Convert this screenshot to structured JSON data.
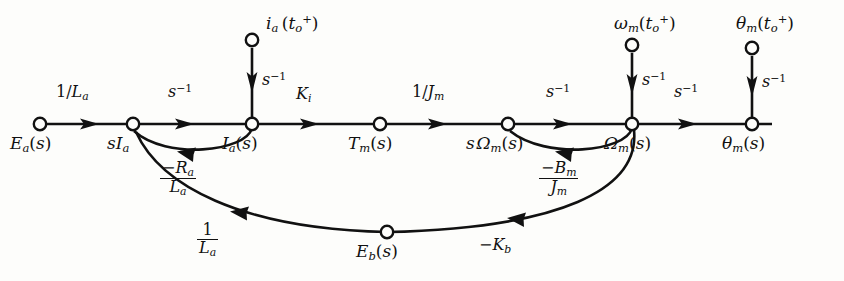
{
  "diagram": {
    "type": "signal-flow-graph",
    "stroke_color": "#111111",
    "background_color": "#fdfdfb"
  },
  "nodes": [
    {
      "id": "Ea",
      "label": "E_a(s)",
      "x": 40,
      "y": 124,
      "label_x": 10,
      "label_y": 133,
      "kind": "source"
    },
    {
      "id": "sIa",
      "label": "sI_a",
      "x": 133,
      "y": 124,
      "label_x": 107,
      "label_y": 133,
      "kind": "internal"
    },
    {
      "id": "Ia",
      "label": "I_a(s)",
      "x": 252,
      "y": 124,
      "label_x": 222,
      "label_y": 133,
      "kind": "internal"
    },
    {
      "id": "Tm",
      "label": "T_m(s)",
      "x": 380,
      "y": 124,
      "label_x": 348,
      "label_y": 133,
      "kind": "internal"
    },
    {
      "id": "sOmegam",
      "label": "sΩ_m(s)",
      "x": 508,
      "y": 124,
      "label_x": 468,
      "label_y": 133,
      "kind": "internal"
    },
    {
      "id": "Omegam",
      "label": "Ω_m(s)",
      "x": 632,
      "y": 124,
      "label_x": 606,
      "label_y": 133,
      "kind": "internal"
    },
    {
      "id": "thetam",
      "label": "θ_m(s)",
      "x": 752,
      "y": 124,
      "label_x": 724,
      "label_y": 133,
      "kind": "output"
    },
    {
      "id": "ia0",
      "label": "i_a(t_o^+)",
      "x": 252,
      "y": 40,
      "label_x": 266,
      "label_y": 12,
      "kind": "initial-condition"
    },
    {
      "id": "omega0",
      "label": "ω_m(t_o^+)",
      "x": 632,
      "y": 45,
      "label_x": 618,
      "label_y": 12,
      "kind": "initial-condition"
    },
    {
      "id": "theta0",
      "label": "θ_m(t_o^+)",
      "x": 752,
      "y": 48,
      "label_x": 740,
      "label_y": 12,
      "kind": "initial-condition"
    }
  ],
  "branches": [
    {
      "id": "b1",
      "from": "Ea",
      "to": "sIa",
      "gain": "1/L_a",
      "gain_x": 62,
      "gain_y": 82,
      "shape": "straight"
    },
    {
      "id": "b2",
      "from": "sIa",
      "to": "Ia",
      "gain": "s^-1",
      "gain_x": 172,
      "gain_y": 82,
      "shape": "straight"
    },
    {
      "id": "b3",
      "from": "Ia",
      "to": "Tm",
      "gain": "K_i",
      "gain_x": 298,
      "gain_y": 84,
      "shape": "straight"
    },
    {
      "id": "b4",
      "from": "Tm",
      "to": "sOmegam",
      "gain": "1/J_m",
      "gain_x": 418,
      "gain_y": 82,
      "shape": "straight"
    },
    {
      "id": "b5",
      "from": "sOmegam",
      "to": "Omegam",
      "gain": "s^-1",
      "gain_x": 550,
      "gain_y": 82,
      "shape": "straight"
    },
    {
      "id": "b6",
      "from": "Omegam",
      "to": "thetam",
      "gain": "s^-1",
      "gain_x": 678,
      "gain_y": 82,
      "shape": "straight"
    },
    {
      "id": "b7",
      "from": "ia0",
      "to": "Ia",
      "gain": "s^-1",
      "gain_x": 262,
      "gain_y": 72,
      "shape": "vertical"
    },
    {
      "id": "b8",
      "from": "omega0",
      "to": "Omegam",
      "gain": "s^-1",
      "gain_x": 642,
      "gain_y": 72,
      "shape": "vertical"
    },
    {
      "id": "b9",
      "from": "theta0",
      "to": "thetam",
      "gain": "s^-1",
      "gain_x": 762,
      "gain_y": 74,
      "shape": "vertical"
    },
    {
      "id": "b10",
      "from": "Ia",
      "to": "sIa",
      "gain": "-R_a/L_a",
      "gain_x": 172,
      "gain_y": 143,
      "shape": "arc-below-short"
    },
    {
      "id": "b11",
      "from": "Omegam",
      "to": "sOmegam",
      "gain": "-B_m/J_m",
      "gain_x": 551,
      "gain_y": 143,
      "shape": "arc-below-short"
    },
    {
      "id": "b12",
      "from": "Omegam",
      "to": "Eb",
      "gain": "-K_b",
      "gain_x": 487,
      "gain_y": 241,
      "shape": "arc-below-long"
    },
    {
      "id": "b13",
      "from": "Eb",
      "to": "sIa",
      "gain": "1/L_a",
      "gain_x": 205,
      "gain_y": 228,
      "shape": "arc-below-long"
    }
  ],
  "bottom_node": {
    "id": "Eb",
    "label": "E_b(s)",
    "x": 387,
    "y": 232,
    "label_x": 358,
    "label_y": 241
  }
}
